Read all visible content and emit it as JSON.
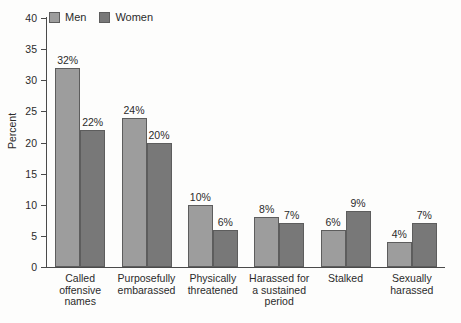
{
  "chart_data": {
    "type": "bar",
    "title": "",
    "xlabel": "",
    "ylabel": "Percent",
    "ylim": [
      0,
      40
    ],
    "yticks": [
      0,
      5,
      10,
      15,
      20,
      25,
      30,
      35,
      40
    ],
    "ytick_labels": [
      "0",
      "5",
      "10",
      "15",
      "20",
      "25",
      "30",
      "35",
      "40"
    ],
    "grid": false,
    "legend_position": "top-left",
    "value_suffix": "%",
    "categories": [
      "Called offensive names",
      "Purposefully embarassed",
      "Physically threatened",
      "Harassed for a sustained period",
      "Stalked",
      "Sexually harassed"
    ],
    "category_lines": [
      [
        "Called",
        "offensive",
        "names"
      ],
      [
        "Purposefully",
        "embarassed"
      ],
      [
        "Physically",
        "threatened"
      ],
      [
        "Harassed for",
        "a sustained",
        "period"
      ],
      [
        "Stalked"
      ],
      [
        "Sexually",
        "harassed"
      ]
    ],
    "series": [
      {
        "name": "Men",
        "color": "#9d9d9d",
        "values": [
          32,
          24,
          10,
          8,
          6,
          4
        ],
        "value_labels": [
          "32%",
          "24%",
          "10%",
          "8%",
          "6%",
          "4%"
        ]
      },
      {
        "name": "Women",
        "color": "#787878",
        "values": [
          22,
          20,
          6,
          7,
          9,
          7
        ],
        "value_labels": [
          "22%",
          "20%",
          "6%",
          "7%",
          "9%",
          "7%"
        ]
      }
    ]
  },
  "colors": {
    "men": "#9d9d9d",
    "women": "#787878",
    "axis": "#4a4a4a",
    "text": "#2b2b2b",
    "background": "#fdfdfc"
  }
}
